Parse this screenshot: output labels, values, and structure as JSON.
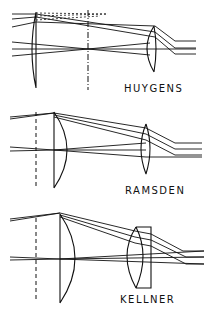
{
  "diagrams": [
    {
      "name": "huygens",
      "label": "HUYGENS",
      "components": [
        "field-lens (plano-convex)",
        "field-stop (dash-dot)",
        "eye-lens (plano-convex)"
      ]
    },
    {
      "name": "ramsden",
      "label": "RAMSDEN",
      "components": [
        "field-stop (dashed)",
        "field-lens (plano-convex)",
        "eye-lens (plano-convex)"
      ]
    },
    {
      "name": "kellner",
      "label": "KELLNER",
      "components": [
        "field-stop (dashed)",
        "field-lens (plano-convex)",
        "achromatic doublet eye-lens"
      ]
    }
  ],
  "colors": {
    "ink": "#111111",
    "background": "#ffffff"
  }
}
